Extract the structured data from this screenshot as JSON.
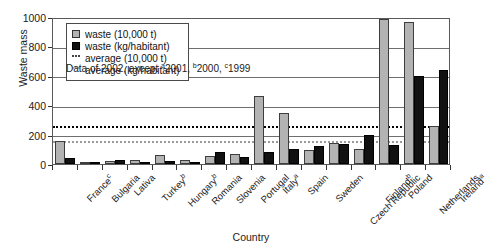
{
  "chart_data": {
    "type": "bar",
    "title": "",
    "xlabel": "Country",
    "ylabel": "Waste mass",
    "ylim": [
      0,
      1000
    ],
    "yticks": [
      0,
      200,
      400,
      600,
      800,
      1000
    ],
    "grid": true,
    "legend_position": "top-left-inside",
    "categories": [
      "France",
      "Bulgaria",
      "Lativa",
      "Turkey",
      "Hungary",
      "Romania",
      "Slovenia",
      "Portugal",
      "Italy",
      "Spain",
      "Sweden",
      "Czech Republic",
      "Finland",
      "Poland",
      "Netherlands",
      "Ireland"
    ],
    "category_superscripts": [
      "c",
      "",
      "",
      "b",
      "b",
      "",
      "",
      "",
      "a",
      "",
      "",
      "",
      "b",
      "",
      "",
      "a"
    ],
    "series": [
      {
        "name": "waste (10,000 t)",
        "color": "#b3b3b3",
        "values": [
          155,
          12,
          18,
          30,
          62,
          30,
          55,
          65,
          460,
          350,
          95,
          145,
          100,
          985,
          968,
          262
        ]
      },
      {
        "name": "waste (kg/habitant)",
        "color": "#111111",
        "values": [
          40,
          10,
          30,
          12,
          20,
          15,
          80,
          48,
          85,
          100,
          120,
          135,
          200,
          128,
          600,
          640
        ]
      }
    ],
    "reference_lines": [
      {
        "name": "average (10,000 t)",
        "value": 270,
        "style": "dotted",
        "color": "#000000"
      },
      {
        "name": "average (kg/habitant)",
        "value": 170,
        "style": "dotted",
        "color": "#9a9a9a"
      }
    ],
    "annotations": [
      {
        "name": "data-note",
        "text": "Data of 2002, except a2001, b2000, c1999",
        "text_parts": [
          "Data of 2002, except ",
          "a",
          "2001, ",
          "b",
          "2000, ",
          "c",
          "1999"
        ]
      }
    ]
  },
  "legend": {
    "items": [
      {
        "label": "waste (10,000 t)",
        "swatch": "square-gray"
      },
      {
        "label": "waste (kg/habitant)",
        "swatch": "square-black"
      },
      {
        "label": "average (10,000 t)",
        "swatch": "dotted-black"
      },
      {
        "label": "average (kg/habitant)",
        "swatch": "dotted-gray"
      }
    ]
  },
  "note": {
    "prefix": "Data of 2002, except ",
    "sup_a": "a",
    "year_a": "2001, ",
    "sup_b": "b",
    "year_b": "2000, ",
    "sup_c": "c",
    "year_c": "1999"
  },
  "axes": {
    "y_title": "Waste mass",
    "x_title": "Country",
    "y_tick_labels": [
      "1000",
      "800",
      "600",
      "400",
      "200",
      "0"
    ]
  }
}
